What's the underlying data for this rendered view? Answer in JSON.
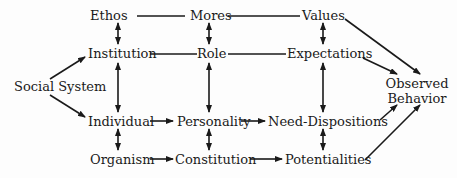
{
  "diagram": {
    "nodes": {
      "social_system": "Social System",
      "ethos": "Ethos",
      "mores": "Mores",
      "values": "Values",
      "institution": "Institution",
      "role": "Role",
      "expectations": "Expectations",
      "individual": "Individual",
      "personality": "Personality",
      "need_dispositions": "Need-Dispositions",
      "organism": "Organism",
      "constitution": "Constitution",
      "potentialities": "Potentialities",
      "observed_line1": "Observed",
      "observed_line2": "Behavior"
    },
    "edges": [
      {
        "from": "Social System",
        "to": "Institution",
        "type": "arrow"
      },
      {
        "from": "Social System",
        "to": "Individual",
        "type": "arrow"
      },
      {
        "from": "Ethos",
        "to": "Mores",
        "type": "line"
      },
      {
        "from": "Mores",
        "to": "Values",
        "type": "line"
      },
      {
        "from": "Institution",
        "to": "Role",
        "type": "line"
      },
      {
        "from": "Role",
        "to": "Expectations",
        "type": "line"
      },
      {
        "from": "Individual",
        "to": "Personality",
        "type": "arrow"
      },
      {
        "from": "Personality",
        "to": "Need-Dispositions",
        "type": "arrow"
      },
      {
        "from": "Organism",
        "to": "Constitution",
        "type": "arrow"
      },
      {
        "from": "Constitution",
        "to": "Potentialities",
        "type": "arrow"
      },
      {
        "from": "Ethos",
        "to": "Institution",
        "type": "double-arrow"
      },
      {
        "from": "Mores",
        "to": "Role",
        "type": "double-arrow"
      },
      {
        "from": "Values",
        "to": "Expectations",
        "type": "double-arrow"
      },
      {
        "from": "Institution",
        "to": "Individual",
        "type": "double-arrow"
      },
      {
        "from": "Role",
        "to": "Personality",
        "type": "double-arrow"
      },
      {
        "from": "Expectations",
        "to": "Need-Dispositions",
        "type": "double-arrow"
      },
      {
        "from": "Individual",
        "to": "Organism",
        "type": "double-arrow"
      },
      {
        "from": "Personality",
        "to": "Constitution",
        "type": "double-arrow"
      },
      {
        "from": "Need-Dispositions",
        "to": "Potentialities",
        "type": "double-arrow"
      },
      {
        "from": "Values",
        "to": "Observed Behavior",
        "type": "arrow"
      },
      {
        "from": "Expectations",
        "to": "Observed Behavior",
        "type": "arrow"
      },
      {
        "from": "Need-Dispositions",
        "to": "Observed Behavior",
        "type": "arrow"
      },
      {
        "from": "Potentialities",
        "to": "Observed Behavior",
        "type": "arrow"
      }
    ]
  }
}
